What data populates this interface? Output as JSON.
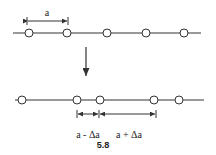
{
  "diagram": {
    "top_chain": {
      "line": {
        "x1": 13,
        "x2": 201,
        "y": 33
      },
      "atoms_x": [
        29,
        67,
        107,
        146,
        184
      ],
      "spacing_label": "a",
      "spacing_dim": {
        "x1": 27,
        "x2": 68,
        "y": 21
      }
    },
    "arrow": {
      "x": 86,
      "y1": 47,
      "y2": 83
    },
    "bottom_chain": {
      "line": {
        "x1": 15,
        "x2": 204,
        "y": 100
      },
      "atoms_x": [
        22,
        77,
        100,
        154,
        179
      ],
      "dims": {
        "y": 114,
        "short": {
          "x1": 77,
          "x2": 99,
          "label": "a - Δa"
        },
        "long": {
          "x1": 99,
          "x2": 156,
          "label": "a + Δa"
        }
      }
    },
    "figure_label": "5.8",
    "colors": {
      "stroke": "#333333",
      "atom_fill": "#ffffff"
    }
  }
}
